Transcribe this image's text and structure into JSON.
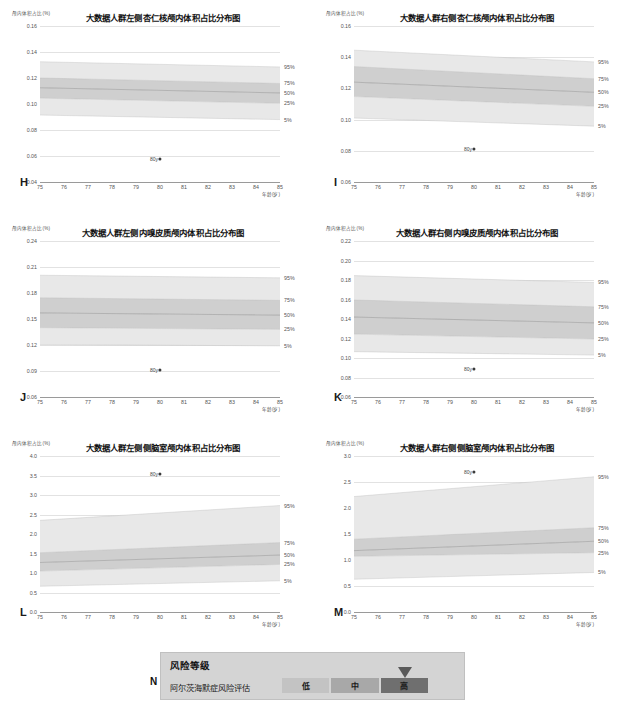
{
  "page": {
    "axis_x_label": "年龄(岁)",
    "axis_y_label": "颅内体积占比(%)",
    "point_label": "80y"
  },
  "charts": [
    {
      "letter": "H",
      "title": "大数据人群左侧杏仁核颅内体积占比分布图",
      "x": 6,
      "y": 4,
      "chart_data": {
        "type": "area",
        "title": "大数据人群左侧杏仁核颅内体积占比分布图",
        "xlabel": "年龄(岁)",
        "ylabel": "颅内体积占比(%)",
        "xlim": [
          75,
          85
        ],
        "ylim": [
          0.04,
          0.16
        ],
        "yticks": [
          0.04,
          0.06,
          0.08,
          0.1,
          0.12,
          0.14,
          0.16
        ],
        "ytick_labels": [
          "0.04",
          "0.06",
          "0.08",
          "0.10",
          "0.12",
          "0.14",
          "0.16"
        ],
        "xticks": [
          75,
          76,
          77,
          78,
          79,
          80,
          81,
          82,
          83,
          84,
          85
        ],
        "grid": true,
        "legend_position": "right",
        "series": [
          {
            "name": "95%",
            "values": [
              0.1325,
              0.1285
            ]
          },
          {
            "name": "75%",
            "values": [
              0.12,
              0.1158
            ]
          },
          {
            "name": "50%",
            "values": [
              0.1125,
              0.1085
            ]
          },
          {
            "name": "25%",
            "values": [
              0.1045,
              0.1005
            ]
          },
          {
            "name": "5%",
            "values": [
              0.0915,
              0.088
            ]
          }
        ],
        "point": {
          "label": "80y",
          "x": 80,
          "y": 0.0575
        }
      }
    },
    {
      "letter": "I",
      "title": "大数据人群右侧杏仁核颅内体积占比分布图",
      "x": 320,
      "y": 4,
      "chart_data": {
        "type": "area",
        "title": "大数据人群右侧杏仁核颅内体积占比分布图",
        "xlabel": "年龄(岁)",
        "ylabel": "颅内体积占比(%)",
        "xlim": [
          75,
          85
        ],
        "ylim": [
          0.06,
          0.16
        ],
        "yticks": [
          0.06,
          0.08,
          0.1,
          0.12,
          0.14,
          0.16
        ],
        "ytick_labels": [
          "0.06",
          "0.08",
          "0.10",
          "0.12",
          "0.14",
          "0.16"
        ],
        "xticks": [
          75,
          76,
          77,
          78,
          79,
          80,
          81,
          82,
          83,
          84,
          85
        ],
        "grid": true,
        "legend_position": "right",
        "series": [
          {
            "name": "95%",
            "values": [
              0.1445,
              0.137
            ]
          },
          {
            "name": "75%",
            "values": [
              0.134,
              0.1262
            ]
          },
          {
            "name": "50%",
            "values": [
              0.124,
              0.1175
            ]
          },
          {
            "name": "25%",
            "values": [
              0.1148,
              0.1085
            ]
          },
          {
            "name": "5%",
            "values": [
              0.101,
              0.0958
            ]
          }
        ],
        "point": {
          "label": "80y",
          "x": 80,
          "y": 0.081
        }
      }
    },
    {
      "letter": "J",
      "title": "大数据人群左侧内嗅皮质颅内体积占比分布图",
      "x": 6,
      "y": 219,
      "chart_data": {
        "type": "area",
        "title": "大数据人群左侧内嗅皮质颅内体积占比分布图",
        "xlabel": "年龄(岁)",
        "ylabel": "颅内体积占比(%)",
        "xlim": [
          75,
          85
        ],
        "ylim": [
          0.06,
          0.24
        ],
        "yticks": [
          0.06,
          0.09,
          0.12,
          0.15,
          0.18,
          0.21,
          0.24
        ],
        "ytick_labels": [
          "0.06",
          "0.09",
          "0.12",
          "0.15",
          "0.18",
          "0.21",
          "0.24"
        ],
        "xticks": [
          75,
          76,
          77,
          78,
          79,
          80,
          81,
          82,
          83,
          84,
          85
        ],
        "grid": true,
        "legend_position": "right",
        "series": [
          {
            "name": "95%",
            "values": [
              0.2005,
              0.1975
            ]
          },
          {
            "name": "75%",
            "values": [
              0.1745,
              0.1715
            ]
          },
          {
            "name": "50%",
            "values": [
              0.157,
              0.1545
            ]
          },
          {
            "name": "25%",
            "values": [
              0.14,
              0.138
            ]
          },
          {
            "name": "5%",
            "values": [
              0.1205,
              0.119
            ]
          }
        ],
        "point": {
          "label": "80y",
          "x": 80,
          "y": 0.0915
        }
      }
    },
    {
      "letter": "K",
      "title": "大数据人群右侧内嗅皮质颅内体积占比分布图",
      "x": 320,
      "y": 219,
      "chart_data": {
        "type": "area",
        "title": "大数据人群右侧内嗅皮质颅内体积占比分布图",
        "xlabel": "年龄(岁)",
        "ylabel": "颅内体积占比(%)",
        "xlim": [
          75,
          85
        ],
        "ylim": [
          0.06,
          0.22
        ],
        "yticks": [
          0.06,
          0.08,
          0.1,
          0.12,
          0.14,
          0.16,
          0.18,
          0.2,
          0.22
        ],
        "ytick_labels": [
          "0.06",
          "0.08",
          "0.10",
          "0.12",
          "0.14",
          "0.16",
          "0.18",
          "0.20",
          "0.22"
        ],
        "xticks": [
          75,
          76,
          77,
          78,
          79,
          80,
          81,
          82,
          83,
          84,
          85
        ],
        "grid": true,
        "legend_position": "right",
        "series": [
          {
            "name": "95%",
            "values": [
              0.1845,
              0.1775
            ]
          },
          {
            "name": "75%",
            "values": [
              0.1595,
              0.1525
            ]
          },
          {
            "name": "50%",
            "values": [
              0.142,
              0.136
            ]
          },
          {
            "name": "25%",
            "values": [
              0.1245,
              0.1195
            ]
          },
          {
            "name": "5%",
            "values": [
              0.1065,
              0.103
            ]
          }
        ],
        "point": {
          "label": "80y",
          "x": 80,
          "y": 0.089
        }
      }
    },
    {
      "letter": "L",
      "title": "大数据人群左侧侧脑室颅内体积占比分布图",
      "x": 6,
      "y": 434,
      "chart_data": {
        "type": "area",
        "title": "大数据人群左侧侧脑室颅内体积占比分布图",
        "xlabel": "年龄(岁)",
        "ylabel": "颅内体积占比(%)",
        "xlim": [
          75,
          85
        ],
        "ylim": [
          0.0,
          4.0
        ],
        "yticks": [
          0.0,
          0.5,
          1.0,
          1.5,
          2.0,
          2.5,
          3.0,
          3.5,
          4.0
        ],
        "ytick_labels": [
          "0.0",
          "0.5",
          "1.0",
          "1.5",
          "2.0",
          "2.5",
          "3.0",
          "3.5",
          "4.0"
        ],
        "xticks": [
          75,
          76,
          77,
          78,
          79,
          80,
          81,
          82,
          83,
          84,
          85
        ],
        "grid": true,
        "legend_position": "right",
        "series": [
          {
            "name": "95%",
            "values": [
              2.35,
              2.73
            ]
          },
          {
            "name": "75%",
            "values": [
              1.52,
              1.78
            ]
          },
          {
            "name": "50%",
            "values": [
              1.27,
              1.46
            ]
          },
          {
            "name": "25%",
            "values": [
              1.05,
              1.22
            ]
          },
          {
            "name": "5%",
            "values": [
              0.66,
              0.8
            ]
          }
        ],
        "point": {
          "label": "80y",
          "x": 80,
          "y": 3.55
        }
      }
    },
    {
      "letter": "M",
      "title": "大数据人群右侧侧脑室颅内体积占比分布图",
      "x": 320,
      "y": 434,
      "chart_data": {
        "type": "area",
        "title": "大数据人群右侧侧脑室颅内体积占比分布图",
        "xlabel": "年龄(岁)",
        "ylabel": "颅内体积占比(%)",
        "xlim": [
          75,
          85
        ],
        "ylim": [
          0.0,
          3.0
        ],
        "yticks": [
          0.0,
          0.5,
          1.0,
          1.5,
          2.0,
          2.5,
          3.0
        ],
        "ytick_labels": [
          "0.0",
          "0.5",
          "1.0",
          "1.5",
          "2.0",
          "2.5",
          "3.0"
        ],
        "xticks": [
          75,
          76,
          77,
          78,
          79,
          80,
          81,
          82,
          83,
          84,
          85
        ],
        "grid": true,
        "legend_position": "right",
        "series": [
          {
            "name": "95%",
            "values": [
              2.22,
              2.6
            ]
          },
          {
            "name": "75%",
            "values": [
              1.4,
              1.62
            ]
          },
          {
            "name": "50%",
            "values": [
              1.18,
              1.36
            ]
          },
          {
            "name": "25%",
            "values": [
              1.07,
              1.14
            ]
          },
          {
            "name": "5%",
            "values": [
              0.63,
              0.76
            ]
          }
        ],
        "point": {
          "label": "80y",
          "x": 80,
          "y": 2.7
        }
      }
    }
  ],
  "risk": {
    "letter": "N",
    "header": "风险等级",
    "assessment_label": "阿尔茨海默症风险评估",
    "levels": [
      "低",
      "中",
      "高"
    ],
    "selected_level": "高",
    "colors": {
      "low": "#c3c3c3",
      "mid": "#a8a8a8",
      "high": "#6f6f6f",
      "panel": "#d4d4d4",
      "marker": "#5a5a5a"
    }
  }
}
